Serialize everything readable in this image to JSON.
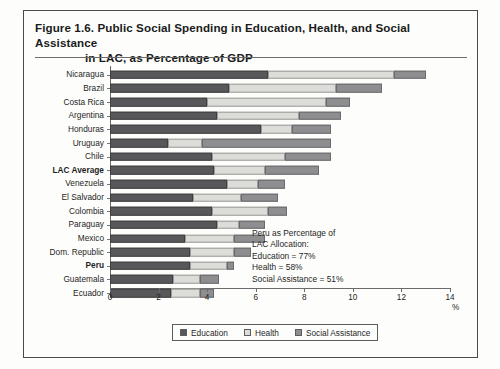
{
  "figure": {
    "title_line1": "Figure 1.6.  Public Social Spending in Education, Health, and Social Assistance",
    "title_line2": "in LAC, as Percentage of GDP"
  },
  "annotation": {
    "line1": "Peru as Percentage of",
    "line2": "LAC Allocation:",
    "line3": "Education = 77%",
    "line4": "Health = 58%",
    "line5": "Social Assistance = 51%"
  },
  "legend": {
    "items": [
      {
        "label": "Education",
        "color": "#58585a"
      },
      {
        "label": "Health",
        "color": "#dcdcd8"
      },
      {
        "label": "Social Assistance",
        "color": "#8e8e90"
      }
    ]
  },
  "axis": {
    "x_unit_label": "%",
    "x_ticks": [
      "0",
      "2",
      "4",
      "6",
      "8",
      "10",
      "12",
      "14"
    ]
  },
  "chart_data": {
    "type": "bar",
    "orientation": "horizontal",
    "stacked": true,
    "title": "Figure 1.6.  Public Social Spending in Education, Health, and Social Assistance in LAC, as Percentage of GDP",
    "xlabel": "%",
    "ylabel": "",
    "xlim": [
      0,
      14
    ],
    "xticks": [
      0,
      2,
      4,
      6,
      8,
      10,
      12,
      14
    ],
    "grid": false,
    "legend_position": "bottom",
    "categories": [
      "Nicaragua",
      "Brazil",
      "Costa Rica",
      "Argentina",
      "Honduras",
      "Uruguay",
      "Chile",
      "LAC Average",
      "Venezuela",
      "El Salvador",
      "Colombia",
      "Paraguay",
      "Mexico",
      "Dom. Republic",
      "Peru",
      "Guatemala",
      "Ecuador"
    ],
    "emphasized_categories": [
      "LAC Average",
      "Peru"
    ],
    "series": [
      {
        "name": "Education",
        "color": "#58585a",
        "values": [
          6.5,
          4.9,
          4.0,
          4.4,
          6.2,
          2.4,
          4.2,
          4.3,
          4.8,
          3.4,
          4.2,
          4.4,
          3.1,
          3.3,
          3.3,
          2.6,
          2.5
        ]
      },
      {
        "name": "Health",
        "color": "#dcdcd8",
        "values": [
          5.2,
          4.4,
          4.9,
          3.4,
          1.3,
          1.4,
          3.0,
          2.1,
          1.3,
          2.0,
          2.3,
          0.9,
          2.0,
          1.8,
          1.5,
          1.1,
          1.2
        ]
      },
      {
        "name": "Social Assistance",
        "color": "#8e8e90",
        "values": [
          1.3,
          1.9,
          1.0,
          1.7,
          1.6,
          5.3,
          1.9,
          2.2,
          1.1,
          1.5,
          0.8,
          1.1,
          1.3,
          0.7,
          0.3,
          0.8,
          0.6
        ]
      }
    ],
    "totals": [
      13.0,
      11.2,
      9.9,
      9.5,
      9.1,
      9.1,
      9.1,
      8.6,
      7.2,
      6.9,
      7.3,
      6.4,
      6.4,
      5.8,
      5.1,
      4.5,
      4.3
    ],
    "annotation": "Peru as Percentage of LAC Allocation: Education = 77%; Health = 58%; Social Assistance = 51%"
  }
}
